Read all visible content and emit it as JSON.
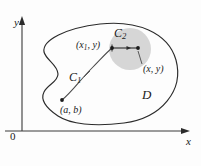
{
  "figure": {
    "background_color": "#fdfdfd",
    "ink_color": "#2b2b2b",
    "disk_fill_color": "#d4d4d4"
  },
  "axes": {
    "y_label": "y",
    "x_label": "x",
    "origin_label": "0",
    "x_axis_arrow": "arrow-right",
    "y_axis_arrow": "arrow-up"
  },
  "labels": {
    "region": "D",
    "curve_1_base": "C",
    "curve_1_sub": "1",
    "curve_2_base": "C",
    "curve_2_sub": "2",
    "point_start": "(a, b)",
    "point_mid_prefix": "(x",
    "point_mid_sub": "1",
    "point_mid_suffix": ", y)",
    "point_end": "(x, y)"
  },
  "points": [
    {
      "name": "start-point",
      "label": "(a, b)",
      "x": 62,
      "y": 100
    },
    {
      "name": "mid-point",
      "label": "(x1, y)",
      "x": 112,
      "y": 48
    },
    {
      "name": "end-point",
      "label": "(x, y)",
      "x": 138,
      "y": 50
    }
  ],
  "geometry": {
    "disk_center_x": 130,
    "disk_center_y": 49,
    "disk_radius": 21,
    "y_axis_x": 22,
    "x_axis_y": 131
  }
}
